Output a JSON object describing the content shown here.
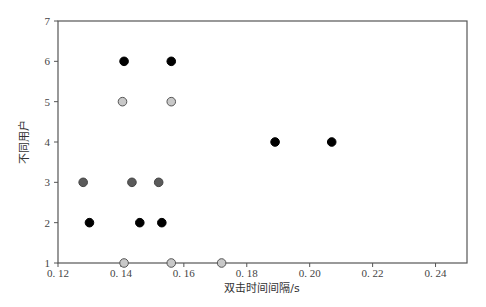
{
  "chart_data": {
    "type": "scatter",
    "title": "",
    "xlabel": "双击时间间隔/s",
    "ylabel": "不同用户",
    "xlim": [
      0.12,
      0.25
    ],
    "ylim": [
      1,
      7
    ],
    "xticks": [
      0.12,
      0.14,
      0.16,
      0.18,
      0.2,
      0.22,
      0.24
    ],
    "xtick_labels": [
      "0. 12",
      "0. 14",
      "0. 16",
      "0. 18",
      "0. 20",
      "0. 22",
      "0. 24"
    ],
    "yticks": [
      1,
      2,
      3,
      4,
      5,
      6,
      7
    ],
    "ytick_labels": [
      "1",
      "2",
      "3",
      "4",
      "5",
      "6",
      "7"
    ],
    "grid": false,
    "legend": null,
    "series": [
      {
        "name": "用户1",
        "color": "#c8c8c8",
        "edge": "#555555",
        "points": [
          [
            0.141,
            1
          ],
          [
            0.156,
            1
          ],
          [
            0.172,
            1
          ]
        ]
      },
      {
        "name": "用户2",
        "color": "#000000",
        "edge": "#000000",
        "points": [
          [
            0.13,
            2
          ],
          [
            0.146,
            2
          ],
          [
            0.153,
            2
          ]
        ]
      },
      {
        "name": "用户3",
        "color": "#5a5a5a",
        "edge": "#444444",
        "points": [
          [
            0.128,
            3
          ],
          [
            0.1435,
            3
          ],
          [
            0.152,
            3
          ]
        ]
      },
      {
        "name": "用户4",
        "color": "#000000",
        "edge": "#000000",
        "points": [
          [
            0.189,
            4
          ],
          [
            0.207,
            4
          ]
        ]
      },
      {
        "name": "用户5",
        "color": "#c8c8c8",
        "edge": "#555555",
        "points": [
          [
            0.1405,
            5
          ],
          [
            0.156,
            5
          ]
        ]
      },
      {
        "name": "用户6",
        "color": "#000000",
        "edge": "#000000",
        "points": [
          [
            0.141,
            6
          ],
          [
            0.156,
            6
          ]
        ]
      }
    ]
  }
}
